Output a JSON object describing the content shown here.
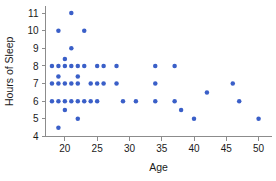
{
  "chart_data": {
    "type": "scatter",
    "title": "",
    "xlabel": "Age",
    "ylabel": "Hours of Sleep",
    "xlim": [
      17,
      52
    ],
    "ylim": [
      4,
      11.4
    ],
    "xticks": [
      20,
      25,
      30,
      35,
      40,
      45,
      50
    ],
    "yticks": [
      4,
      5,
      6,
      7,
      8,
      9,
      10,
      11
    ],
    "grid": false,
    "legend": null,
    "point_color": "#3a5fc8",
    "points": [
      {
        "x": 18,
        "y": 8
      },
      {
        "x": 18,
        "y": 7
      },
      {
        "x": 18,
        "y": 6
      },
      {
        "x": 19,
        "y": 10
      },
      {
        "x": 19,
        "y": 8
      },
      {
        "x": 19,
        "y": 7.4
      },
      {
        "x": 19,
        "y": 7
      },
      {
        "x": 19,
        "y": 6
      },
      {
        "x": 19,
        "y": 4.5
      },
      {
        "x": 20,
        "y": 8.4
      },
      {
        "x": 20,
        "y": 8
      },
      {
        "x": 20,
        "y": 7
      },
      {
        "x": 20,
        "y": 6
      },
      {
        "x": 20,
        "y": 5.5
      },
      {
        "x": 21,
        "y": 11
      },
      {
        "x": 21,
        "y": 9
      },
      {
        "x": 21,
        "y": 8
      },
      {
        "x": 21,
        "y": 7
      },
      {
        "x": 21,
        "y": 6
      },
      {
        "x": 22,
        "y": 8
      },
      {
        "x": 22,
        "y": 7.4
      },
      {
        "x": 22,
        "y": 7
      },
      {
        "x": 22,
        "y": 6
      },
      {
        "x": 22,
        "y": 5
      },
      {
        "x": 23,
        "y": 10
      },
      {
        "x": 23,
        "y": 8
      },
      {
        "x": 23,
        "y": 6
      },
      {
        "x": 24,
        "y": 7
      },
      {
        "x": 24,
        "y": 6
      },
      {
        "x": 25,
        "y": 8
      },
      {
        "x": 25,
        "y": 7
      },
      {
        "x": 25,
        "y": 6
      },
      {
        "x": 26,
        "y": 8
      },
      {
        "x": 26,
        "y": 7
      },
      {
        "x": 28,
        "y": 8
      },
      {
        "x": 28,
        "y": 7
      },
      {
        "x": 29,
        "y": 6
      },
      {
        "x": 31,
        "y": 6
      },
      {
        "x": 34,
        "y": 8
      },
      {
        "x": 34,
        "y": 7
      },
      {
        "x": 34,
        "y": 6
      },
      {
        "x": 37,
        "y": 8
      },
      {
        "x": 37,
        "y": 6
      },
      {
        "x": 38,
        "y": 5.5
      },
      {
        "x": 40,
        "y": 5
      },
      {
        "x": 42,
        "y": 6.5
      },
      {
        "x": 46,
        "y": 7
      },
      {
        "x": 47,
        "y": 6
      },
      {
        "x": 50,
        "y": 5
      }
    ]
  }
}
